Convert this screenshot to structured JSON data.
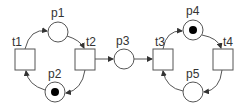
{
  "diagram": {
    "type": "petri-net",
    "places": [
      {
        "id": "p1",
        "label": "p1",
        "cx": 58,
        "cy": 32,
        "tokens": 0
      },
      {
        "id": "p2",
        "label": "p2",
        "cx": 55,
        "cy": 92,
        "tokens": 1
      },
      {
        "id": "p3",
        "label": "p3",
        "cx": 124,
        "cy": 59,
        "tokens": 0
      },
      {
        "id": "p4",
        "label": "p4",
        "cx": 193,
        "cy": 30,
        "tokens": 1
      },
      {
        "id": "p5",
        "label": "p5",
        "cx": 193,
        "cy": 92,
        "tokens": 0
      }
    ],
    "transitions": [
      {
        "id": "t1",
        "label": "t1",
        "x": 15,
        "y": 49
      },
      {
        "id": "t2",
        "label": "t2",
        "x": 75,
        "y": 49
      },
      {
        "id": "t3",
        "label": "t3",
        "x": 153,
        "y": 49
      },
      {
        "id": "t4",
        "label": "t4",
        "x": 213,
        "y": 49
      }
    ],
    "arcs": [
      {
        "from": "t1",
        "to": "p1"
      },
      {
        "from": "p1",
        "to": "t2"
      },
      {
        "from": "t2",
        "to": "p2"
      },
      {
        "from": "p2",
        "to": "t1"
      },
      {
        "from": "t2",
        "to": "p3"
      },
      {
        "from": "p3",
        "to": "t3"
      },
      {
        "from": "t3",
        "to": "p4"
      },
      {
        "from": "p4",
        "to": "t4"
      },
      {
        "from": "t4",
        "to": "p5"
      },
      {
        "from": "p5",
        "to": "t3"
      }
    ],
    "colors": {
      "stroke": "#555555",
      "token": "#000000",
      "text": "#333333"
    }
  }
}
